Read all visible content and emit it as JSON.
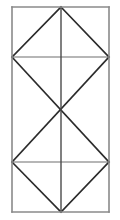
{
  "figure": {
    "title": "Geometric line figure",
    "background_color": "#ffffff",
    "canvas": {
      "width": 120,
      "height": 220
    },
    "colors": {
      "frame_stroke": "#8a8a8a",
      "divider_stroke": "#6e6e6e",
      "center_line_stroke": "#4a4a4a",
      "diagonal_stroke": "#2b2b2b"
    },
    "stroke_widths": {
      "frame": 1.6,
      "divider": 1.2,
      "center_line": 1.4,
      "diagonal": 1.6
    },
    "bounds": {
      "left": 12,
      "right": 109,
      "top": 7,
      "bottom": 212
    },
    "guides": {
      "center_x": 61,
      "upper_divider_y": 57,
      "lower_divider_y": 162
    },
    "vertices": {
      "top_left": {
        "x": 12,
        "y": 7
      },
      "top_mid": {
        "x": 61,
        "y": 7
      },
      "top_right": {
        "x": 109,
        "y": 7
      },
      "upper_left": {
        "x": 12,
        "y": 57
      },
      "upper_mid": {
        "x": 61,
        "y": 57
      },
      "upper_right": {
        "x": 109,
        "y": 57
      },
      "center": {
        "x": 61,
        "y": 110
      },
      "lower_left": {
        "x": 12,
        "y": 162
      },
      "lower_mid": {
        "x": 61,
        "y": 162
      },
      "lower_right": {
        "x": 109,
        "y": 162
      },
      "bottom_left": {
        "x": 12,
        "y": 212
      },
      "bottom_mid": {
        "x": 61,
        "y": 212
      },
      "bottom_right": {
        "x": 109,
        "y": 212
      }
    },
    "panels": [
      {
        "name": "top-panel",
        "pattern": "triangle-apex-up",
        "y_range": [
          7,
          57
        ]
      },
      {
        "name": "middle-panel",
        "pattern": "x-cross",
        "y_range": [
          57,
          162
        ]
      },
      {
        "name": "bottom-panel",
        "pattern": "triangle-apex-down",
        "y_range": [
          162,
          212
        ]
      }
    ],
    "segments": {
      "frame": [
        {
          "name": "frame-top",
          "x1": 12,
          "y1": 7,
          "x2": 109,
          "y2": 7
        },
        {
          "name": "frame-right",
          "x1": 109,
          "y1": 7,
          "x2": 109,
          "y2": 212
        },
        {
          "name": "frame-bottom",
          "x1": 109,
          "y1": 212,
          "x2": 12,
          "y2": 212
        },
        {
          "name": "frame-left",
          "x1": 12,
          "y1": 212,
          "x2": 12,
          "y2": 7
        }
      ],
      "dividers": [
        {
          "name": "upper-divider",
          "x1": 12,
          "y1": 57,
          "x2": 109,
          "y2": 57
        },
        {
          "name": "lower-divider",
          "x1": 12,
          "y1": 162,
          "x2": 109,
          "y2": 162
        }
      ],
      "center_line": {
        "name": "vertical-center-line",
        "x1": 61,
        "y1": 7,
        "x2": 61,
        "y2": 212
      },
      "diagonals": [
        {
          "name": "top-left-diagonal",
          "x1": 12,
          "y1": 57,
          "x2": 61,
          "y2": 7
        },
        {
          "name": "top-right-diagonal",
          "x1": 61,
          "y1": 7,
          "x2": 109,
          "y2": 57
        },
        {
          "name": "middle-down-diagonal",
          "x1": 12,
          "y1": 57,
          "x2": 109,
          "y2": 162
        },
        {
          "name": "middle-up-diagonal",
          "x1": 12,
          "y1": 162,
          "x2": 109,
          "y2": 57
        },
        {
          "name": "bottom-left-diagonal",
          "x1": 12,
          "y1": 162,
          "x2": 61,
          "y2": 212
        },
        {
          "name": "bottom-right-diagonal",
          "x1": 61,
          "y1": 212,
          "x2": 109,
          "y2": 162
        }
      ]
    }
  }
}
